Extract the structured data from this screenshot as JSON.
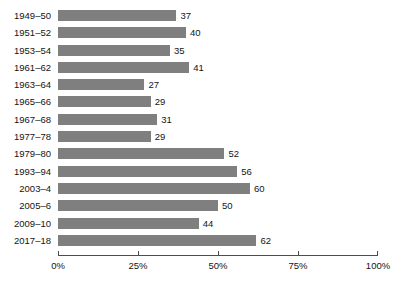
{
  "chart_data": {
    "type": "bar",
    "orientation": "horizontal",
    "title": "",
    "subtitle": "",
    "xlabel": "",
    "ylabel": "",
    "xlim": [
      0,
      100
    ],
    "grid": false,
    "legend": null,
    "bar_color": "#7f7f7f",
    "axis_color": "#4d4d4d",
    "text_color": "#141414",
    "value_suffix": "",
    "categories": [
      "1949–50",
      "1951–52",
      "1953–54",
      "1961–62",
      "1963–64",
      "1965–66",
      "1967–68",
      "1977–78",
      "1979–80",
      "1993–94",
      "2003–4",
      "2005–6",
      "2009–10",
      "2017–18"
    ],
    "values": [
      37,
      40,
      35,
      41,
      27,
      29,
      31,
      29,
      52,
      56,
      60,
      50,
      44,
      62
    ],
    "data_labels": [
      "37",
      "40",
      "35",
      "41",
      "27",
      "29",
      "31",
      "29",
      "52",
      "56",
      "60",
      "50",
      "44",
      "62"
    ],
    "xticks": [
      0,
      25,
      50,
      75,
      100
    ],
    "xtick_labels": [
      "0%",
      "25%",
      "50%",
      "75%",
      "100%"
    ]
  }
}
